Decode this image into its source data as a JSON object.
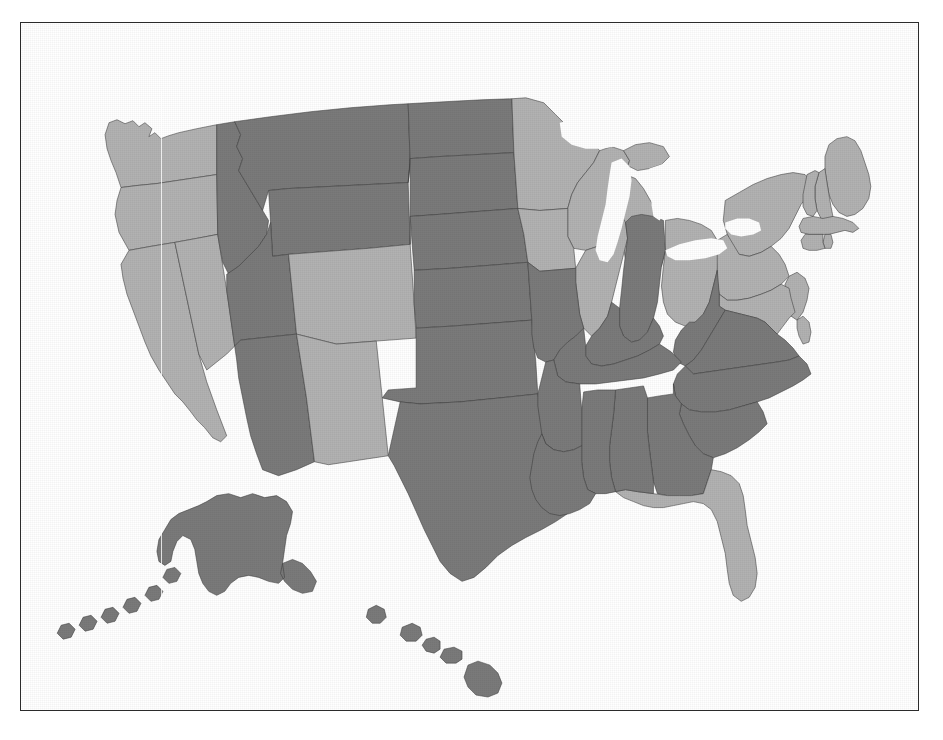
{
  "page": {
    "background_color": "#ffffff",
    "frame_color": "#2b2b2b",
    "frame": {
      "x": 20,
      "y": 22,
      "width": 899,
      "height": 689
    }
  },
  "map": {
    "name": "united-states-choropleth",
    "projection": "albers-usa",
    "includes_insets": [
      "Alaska",
      "Hawaii"
    ],
    "border_color": "#3a3a3a",
    "water_color": "#ffffff",
    "has_halftone_texture": true,
    "has_vertical_scanline_artifact": true
  },
  "legend": {
    "visible": false,
    "categories": [
      {
        "key": "dark",
        "label": "Dark gray category",
        "color": "#7a7a7a"
      },
      {
        "key": "light",
        "label": "Light gray category",
        "color": "#b2b2b2"
      }
    ]
  },
  "chart_data": {
    "type": "choropleth",
    "subtitle": "",
    "xlabel": "",
    "ylabel": "",
    "value_type": "categorical",
    "categories": [
      "dark",
      "light"
    ],
    "category_colors": {
      "dark": "#7a7a7a",
      "light": "#b2b2b2"
    },
    "water_color": "#ffffff",
    "legend_position": "none",
    "grid": false,
    "counts": {
      "dark": 26,
      "light": 24
    },
    "states": [
      {
        "code": "AL",
        "name": "Alabama",
        "category": "dark"
      },
      {
        "code": "AK",
        "name": "Alaska",
        "category": "dark"
      },
      {
        "code": "AZ",
        "name": "Arizona",
        "category": "dark"
      },
      {
        "code": "AR",
        "name": "Arkansas",
        "category": "dark"
      },
      {
        "code": "CA",
        "name": "California",
        "category": "light"
      },
      {
        "code": "CO",
        "name": "Colorado",
        "category": "light"
      },
      {
        "code": "CT",
        "name": "Connecticut",
        "category": "light"
      },
      {
        "code": "DE",
        "name": "Delaware",
        "category": "light"
      },
      {
        "code": "FL",
        "name": "Florida",
        "category": "light"
      },
      {
        "code": "GA",
        "name": "Georgia",
        "category": "dark"
      },
      {
        "code": "HI",
        "name": "Hawaii",
        "category": "dark"
      },
      {
        "code": "ID",
        "name": "Idaho",
        "category": "dark"
      },
      {
        "code": "IL",
        "name": "Illinois",
        "category": "light"
      },
      {
        "code": "IN",
        "name": "Indiana",
        "category": "dark"
      },
      {
        "code": "IA",
        "name": "Iowa",
        "category": "light"
      },
      {
        "code": "KS",
        "name": "Kansas",
        "category": "dark"
      },
      {
        "code": "KY",
        "name": "Kentucky",
        "category": "dark"
      },
      {
        "code": "LA",
        "name": "Louisiana",
        "category": "dark"
      },
      {
        "code": "ME",
        "name": "Maine",
        "category": "light"
      },
      {
        "code": "MD",
        "name": "Maryland",
        "category": "light"
      },
      {
        "code": "MA",
        "name": "Massachusetts",
        "category": "light"
      },
      {
        "code": "MI",
        "name": "Michigan",
        "category": "light"
      },
      {
        "code": "MN",
        "name": "Minnesota",
        "category": "light"
      },
      {
        "code": "MS",
        "name": "Mississippi",
        "category": "dark"
      },
      {
        "code": "MO",
        "name": "Missouri",
        "category": "dark"
      },
      {
        "code": "MT",
        "name": "Montana",
        "category": "dark"
      },
      {
        "code": "NE",
        "name": "Nebraska",
        "category": "dark"
      },
      {
        "code": "NV",
        "name": "Nevada",
        "category": "light"
      },
      {
        "code": "NH",
        "name": "New Hampshire",
        "category": "light"
      },
      {
        "code": "NJ",
        "name": "New Jersey",
        "category": "light"
      },
      {
        "code": "NM",
        "name": "New Mexico",
        "category": "light"
      },
      {
        "code": "NY",
        "name": "New York",
        "category": "light"
      },
      {
        "code": "NC",
        "name": "North Carolina",
        "category": "dark"
      },
      {
        "code": "ND",
        "name": "North Dakota",
        "category": "dark"
      },
      {
        "code": "OH",
        "name": "Ohio",
        "category": "light"
      },
      {
        "code": "OK",
        "name": "Oklahoma",
        "category": "dark"
      },
      {
        "code": "OR",
        "name": "Oregon",
        "category": "light"
      },
      {
        "code": "PA",
        "name": "Pennsylvania",
        "category": "light"
      },
      {
        "code": "RI",
        "name": "Rhode Island",
        "category": "light"
      },
      {
        "code": "SC",
        "name": "South Carolina",
        "category": "dark"
      },
      {
        "code": "SD",
        "name": "South Dakota",
        "category": "dark"
      },
      {
        "code": "TN",
        "name": "Tennessee",
        "category": "dark"
      },
      {
        "code": "TX",
        "name": "Texas",
        "category": "dark"
      },
      {
        "code": "UT",
        "name": "Utah",
        "category": "dark"
      },
      {
        "code": "VT",
        "name": "Vermont",
        "category": "light"
      },
      {
        "code": "VA",
        "name": "Virginia",
        "category": "dark"
      },
      {
        "code": "WA",
        "name": "Washington",
        "category": "light"
      },
      {
        "code": "WV",
        "name": "West Virginia",
        "category": "dark"
      },
      {
        "code": "WI",
        "name": "Wisconsin",
        "category": "light"
      },
      {
        "code": "WY",
        "name": "Wyoming",
        "category": "dark"
      }
    ],
    "lakes": [
      {
        "name": "Lake Superior"
      },
      {
        "name": "Lake Michigan"
      },
      {
        "name": "Lake Huron"
      },
      {
        "name": "Lake Erie"
      },
      {
        "name": "Lake Ontario"
      }
    ]
  }
}
